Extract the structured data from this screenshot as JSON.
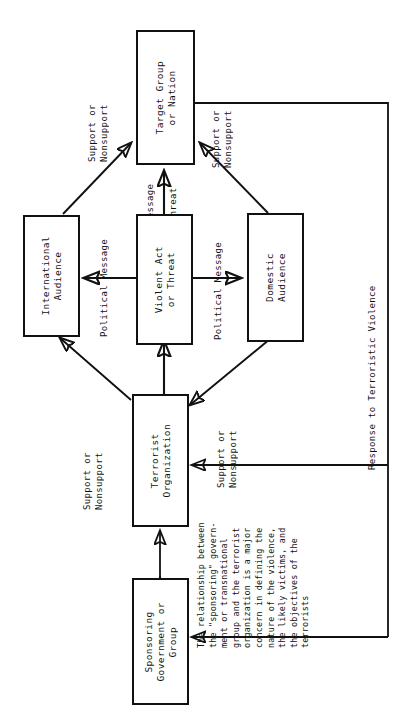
{
  "diagram": {
    "type": "flow-diagram",
    "orientation": "rotated-90-ccw",
    "nodes": [
      {
        "id": "target-group",
        "label": "Target Group\nor Nation"
      },
      {
        "id": "international-audience",
        "label": "International\nAudience"
      },
      {
        "id": "violent-act",
        "label": "Violent Act\nor Threat"
      },
      {
        "id": "domestic-audience",
        "label": "Domestic\nAudience"
      },
      {
        "id": "terrorist-organization",
        "label": "Terrorist\nOrganization"
      },
      {
        "id": "sponsoring-government",
        "label": "Sponsoring\nGovernment or\nGroup"
      }
    ],
    "edge_labels": {
      "support_nonsupport_intl_to_target": "Support or\nNonsupport",
      "support_nonsupport_domestic_to_target": "Support or\nNonsupport",
      "support_nonsupport_intl_to_org": "Support or\nNonsupport",
      "support_nonsupport_domestic_to_org": "Support or\nNonsupport",
      "message": "Message",
      "threat": "Threat",
      "political_message_left": "Political Message",
      "political_message_right": "Political Message",
      "response": "Response to Terroristic Violence"
    },
    "note": "The relationship between\nthe \"sponsoring\" govern-\nment or transnational\ngroup and the terrorist\norganization is a major\nconcern in defining the\nnature of the violence,\nthe likely victims, and\nthe objectives of the\nterrorists",
    "colors": {
      "ink": "#111111",
      "paper": "#ffffff"
    }
  }
}
